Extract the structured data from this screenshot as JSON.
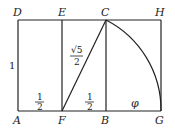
{
  "diagram": {
    "points": {
      "A": {
        "label": "A"
      },
      "D": {
        "label": "D"
      },
      "E": {
        "label": "E"
      },
      "C": {
        "label": "C"
      },
      "H": {
        "label": "H"
      },
      "F": {
        "label": "F"
      },
      "B": {
        "label": "B"
      },
      "G": {
        "label": "G"
      }
    },
    "edge_labels": {
      "AD": "1",
      "AF_num": "1",
      "AF_den": "2",
      "FB_num": "1",
      "FB_den": "2",
      "FC_num": "√5",
      "FC_den": "2",
      "BG": "φ"
    },
    "colors": {
      "line": "#222222",
      "background": "#ffffff"
    }
  }
}
